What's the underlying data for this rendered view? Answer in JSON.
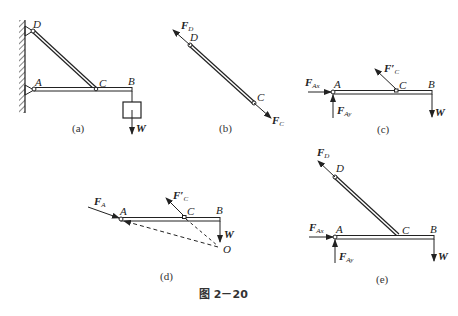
{
  "figure_title": "图 2－20",
  "subfigures": {
    "a": {
      "caption": "(a)",
      "labels": {
        "D": "D",
        "A": "A",
        "C": "C",
        "B": "B",
        "W": "W"
      }
    },
    "b": {
      "caption": "(b)",
      "labels": {
        "D": "D",
        "C": "C"
      },
      "forces": {
        "FD_main": "F",
        "FD_sub": "D",
        "FC_main": "F",
        "FC_sub": "C"
      }
    },
    "c": {
      "caption": "(c)",
      "labels": {
        "A": "A",
        "C": "C",
        "B": "B",
        "W": "W"
      },
      "forces": {
        "FAx_main": "F",
        "FAx_sub": "Ax",
        "FAy_main": "F",
        "FAy_sub": "Ay",
        "FC_main": "F′",
        "FC_sub": "C"
      }
    },
    "d": {
      "caption": "(d)",
      "labels": {
        "A": "A",
        "C": "C",
        "B": "B",
        "W": "W",
        "O": "O"
      },
      "forces": {
        "FA_main": "F",
        "FA_sub": "A",
        "FC_main": "F′",
        "FC_sub": "C"
      }
    },
    "e": {
      "caption": "(e)",
      "labels": {
        "D": "D",
        "A": "A",
        "C": "C",
        "B": "B",
        "W": "W"
      },
      "forces": {
        "FD_main": "F",
        "FD_sub": "D",
        "FAx_main": "F",
        "FAx_sub": "Ax",
        "FAy_main": "F",
        "FAy_sub": "Ay"
      }
    }
  }
}
